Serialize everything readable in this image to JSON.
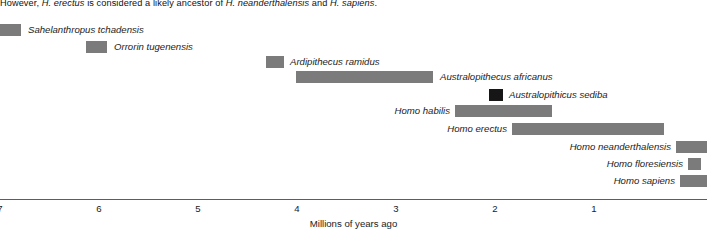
{
  "caption": {
    "text_prefix": "However, ",
    "sp1": "H. erectus",
    "text_mid": " is considered a likely ancestor of ",
    "sp2": "H. neanderthalensis",
    "text_and": " and ",
    "sp3": "H. sapiens",
    "text_end": "."
  },
  "chart_data": {
    "type": "bar",
    "title": "",
    "xlabel": "Millions of years ago",
    "ylabel": "",
    "orientation": "horizontal",
    "x_axis_reversed": true,
    "xlim": [
      7.1,
      -0.15
    ],
    "ticks": [
      7,
      6,
      5,
      4,
      3,
      2,
      1
    ],
    "grid": false,
    "legend": "none",
    "unit": "Millions of years ago",
    "bar_color": "#7b7b7b",
    "highlight_color": "#161616",
    "categories": [
      "Sahelanthropus tchadensis",
      "Orrorin tugenensis",
      "Ardipithecus ramidus",
      "Australopithecus africanus",
      "Australopithicus sediba",
      "Homo habilis",
      "Homo erectus",
      "Homo neanderthalensis",
      "Homo floresiensis",
      "Homo sapiens"
    ],
    "ranges": [
      {
        "name": "Sahelanthropus tchadensis",
        "start_mya": 7.1,
        "end_mya": 6.9,
        "label_side": "right",
        "color": "#7b7b7b"
      },
      {
        "name": "Orrorin tugenensis",
        "start_mya": 6.3,
        "end_mya": 6.1,
        "label_side": "right",
        "color": "#7b7b7b"
      },
      {
        "name": "Ardipithecus ramidus",
        "start_mya": 4.5,
        "end_mya": 4.3,
        "label_side": "right",
        "color": "#7b7b7b"
      },
      {
        "name": "Australopithecus africanus",
        "start_mya": 4.1,
        "end_mya": 2.7,
        "label_side": "right",
        "color": "#7b7b7b"
      },
      {
        "name": "Australopithicus sediba",
        "start_mya": 2.1,
        "end_mya": 1.9,
        "label_side": "right",
        "color": "#161616"
      },
      {
        "name": "Homo habilis",
        "start_mya": 2.5,
        "end_mya": 1.6,
        "label_side": "left",
        "color": "#7b7b7b"
      },
      {
        "name": "Homo erectus",
        "start_mya": 1.9,
        "end_mya": 0.3,
        "label_side": "left",
        "color": "#7b7b7b"
      },
      {
        "name": "Homo neanderthalensis",
        "start_mya": 0.2,
        "end_mya": 0.0,
        "label_side": "left",
        "color": "#7b7b7b"
      },
      {
        "name": "Homo floresiensis",
        "start_mya": 0.1,
        "end_mya": 0.0,
        "label_side": "left",
        "color": "#7b7b7b"
      },
      {
        "name": "Homo sapiens",
        "start_mya": 0.3,
        "end_mya": 0.0,
        "label_side": "left",
        "color": "#7b7b7b"
      }
    ]
  },
  "axis": {
    "tick_labels": [
      "7",
      "6",
      "5",
      "4",
      "3",
      "2",
      "1"
    ],
    "title": "Millions of years ago"
  },
  "rows": [
    {
      "label": "Sahelanthropus tchadensis",
      "bar_left": 0,
      "bar_width": 21,
      "row_top": 7,
      "label_left": 28,
      "dark": false
    },
    {
      "label": "Orrorin tugenensis",
      "bar_left": 86,
      "bar_width": 21,
      "row_top": 24,
      "label_left": 114,
      "dark": false
    },
    {
      "label": "Ardipithecus ramidus",
      "bar_left": 266,
      "bar_width": 18,
      "row_top": 39,
      "label_left": 290,
      "dark": false
    },
    {
      "label": "Australopithecus africanus",
      "bar_left": 296,
      "bar_width": 137,
      "row_top": 54,
      "label_left": 440,
      "dark": false
    },
    {
      "label": "Australopithicus sediba",
      "bar_left": 489,
      "bar_width": 14,
      "row_top": 72,
      "label_left": 509,
      "dark": true
    },
    {
      "label": "Homo habilis",
      "bar_left": 455,
      "bar_width": 97,
      "row_top": 88,
      "label_left": 384,
      "dark": false
    },
    {
      "label": "Homo erectus",
      "bar_left": 512,
      "bar_width": 152,
      "row_top": 106,
      "label_left": 441,
      "dark": false
    },
    {
      "label": "Homo neanderthalensis",
      "bar_left": 676,
      "bar_width": 31,
      "row_top": 124,
      "label_left": 548,
      "dark": false
    },
    {
      "label": "Homo floresiensis",
      "bar_left": 688,
      "bar_width": 13,
      "row_top": 141,
      "label_left": 604,
      "dark": false
    },
    {
      "label": "Homo sapiens",
      "bar_left": 680,
      "bar_width": 27,
      "row_top": 158,
      "label_left": 604,
      "dark": false
    }
  ],
  "tick_positions_px": [
    0,
    99,
    198,
    297,
    396,
    495,
    594
  ]
}
